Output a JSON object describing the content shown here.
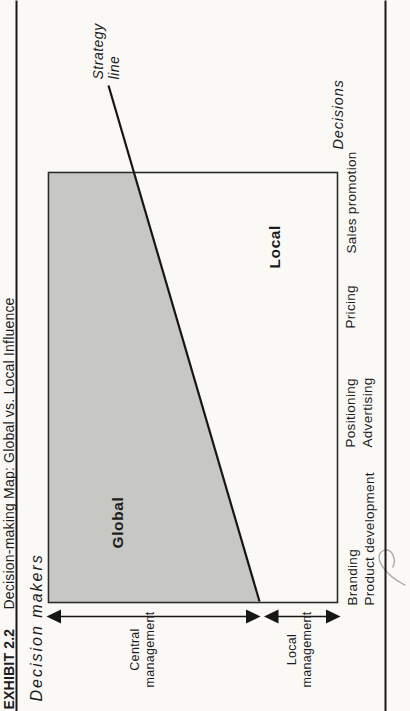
{
  "exhibit": {
    "label": "EXHIBIT 2.2",
    "title": "Decision-making Map: Global vs. Local Influence"
  },
  "axes": {
    "decision_makers_title": "Decision makers",
    "decisions_title": "Decisions",
    "decision_makers": [
      {
        "line1": "Central",
        "line2": "management"
      },
      {
        "line1": "Local",
        "line2": "management"
      }
    ],
    "decisions": [
      {
        "line1": "Branding",
        "line2": "Product development"
      },
      {
        "line1": "Positioning",
        "line2": "Advertising"
      },
      {
        "line1": "Pricing",
        "line2": ""
      },
      {
        "line1": "Sales promotion",
        "line2": ""
      }
    ]
  },
  "regions": {
    "global_label": "Global",
    "local_label": "Local"
  },
  "strategy_line": {
    "label_line1": "Strategy",
    "label_line2": "line"
  },
  "colors": {
    "paper": "#faf9f6",
    "ink": "#1c1c1c",
    "global_fill": "#c7c7c4",
    "box_border": "#2a2a2a"
  }
}
